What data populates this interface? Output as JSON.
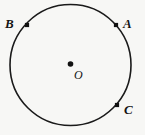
{
  "figure": {
    "kind": "circle-geometry-diagram",
    "background_color": "#f7f7f5",
    "stroke_color": "#1a1a1a",
    "marker_color": "#111111",
    "label_color": "#141414"
  },
  "chart_data": {
    "type": "scatter",
    "title": "",
    "subtitle": "",
    "xlabel": "",
    "ylabel": "",
    "grid": false,
    "legend": "none",
    "xlim": [
      0,
      145
    ],
    "ylim": [
      0,
      135
    ],
    "shapes": [
      {
        "name": "circle",
        "type": "circle",
        "cx": 70.5,
        "cy": 65,
        "r": 60.5,
        "stroke": "#1a1a1a",
        "stroke_width": 1.6,
        "fill": "none"
      }
    ],
    "points": [
      {
        "label": "B",
        "x": 27,
        "y": 25,
        "on_circle": true,
        "marker": "square",
        "marker_size": 4.2,
        "label_dx": -22,
        "label_dy": -8
      },
      {
        "label": "A",
        "x": 116,
        "y": 25,
        "on_circle": true,
        "marker": "square",
        "marker_size": 4.2,
        "label_dx": 7,
        "label_dy": -8
      },
      {
        "label": "C",
        "x": 117,
        "y": 105,
        "on_circle": true,
        "marker": "square",
        "marker_size": 4.2,
        "label_dx": 7,
        "label_dy": -2
      },
      {
        "label": "O",
        "x": 70.5,
        "y": 64,
        "on_circle": false,
        "marker": "dot",
        "marker_size": 3.4,
        "label_dx": 3.5,
        "label_dy": 5
      }
    ],
    "labels": [
      {
        "id": "B",
        "text": "B"
      },
      {
        "id": "A",
        "text": "A"
      },
      {
        "id": "C",
        "text": "C"
      },
      {
        "id": "O",
        "text": "O"
      }
    ]
  }
}
